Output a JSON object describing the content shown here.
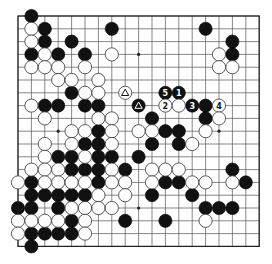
{
  "board": {
    "size": 19,
    "origin_x": 18,
    "origin_y": 16,
    "step_x": 13.4,
    "step_y": 12.8,
    "stone_radius": 6.6,
    "star_points": [
      [
        3,
        3
      ],
      [
        9,
        3
      ],
      [
        15,
        3
      ],
      [
        3,
        9
      ],
      [
        9,
        9
      ],
      [
        15,
        9
      ],
      [
        3,
        15
      ],
      [
        9,
        15
      ],
      [
        15,
        15
      ]
    ],
    "colors": {
      "black": "#111111",
      "white": "#ffffff",
      "line": "#555555"
    }
  },
  "stones": {
    "black": [
      [
        1,
        0
      ],
      [
        2,
        1
      ],
      [
        7,
        1
      ],
      [
        14,
        1
      ],
      [
        2,
        2
      ],
      [
        4,
        2
      ],
      [
        16,
        2
      ],
      [
        1,
        3
      ],
      [
        3,
        3
      ],
      [
        5,
        3
      ],
      [
        16,
        3
      ],
      [
        4,
        6
      ],
      [
        11,
        6
      ],
      [
        12,
        6
      ],
      [
        2,
        7
      ],
      [
        3,
        7
      ],
      [
        5,
        7
      ],
      [
        6,
        7
      ],
      [
        9,
        7
      ],
      [
        13,
        7
      ],
      [
        14,
        7
      ],
      [
        10,
        8
      ],
      [
        14,
        8
      ],
      [
        6,
        9
      ],
      [
        11,
        9
      ],
      [
        12,
        9
      ],
      [
        5,
        10
      ],
      [
        6,
        10
      ],
      [
        10,
        10
      ],
      [
        12,
        10
      ],
      [
        3,
        11
      ],
      [
        4,
        11
      ],
      [
        6,
        11
      ],
      [
        7,
        11
      ],
      [
        9,
        11
      ],
      [
        4,
        12
      ],
      [
        5,
        12
      ],
      [
        6,
        12
      ],
      [
        8,
        12
      ],
      [
        16,
        12
      ],
      [
        1,
        13
      ],
      [
        6,
        13
      ],
      [
        11,
        13
      ],
      [
        12,
        13
      ],
      [
        17,
        13
      ],
      [
        1,
        14
      ],
      [
        2,
        14
      ],
      [
        3,
        14
      ],
      [
        4,
        14
      ],
      [
        5,
        14
      ],
      [
        10,
        14
      ],
      [
        13,
        14
      ],
      [
        0,
        15
      ],
      [
        1,
        15
      ],
      [
        3,
        15
      ],
      [
        14,
        15
      ],
      [
        15,
        15
      ],
      [
        16,
        15
      ],
      [
        4,
        16
      ],
      [
        8,
        16
      ],
      [
        11,
        16
      ],
      [
        1,
        17
      ],
      [
        2,
        17
      ],
      [
        3,
        17
      ],
      [
        4,
        17
      ],
      [
        1,
        18
      ]
    ],
    "white": [
      [
        1,
        1
      ],
      [
        1,
        2
      ],
      [
        2,
        3
      ],
      [
        7,
        3
      ],
      [
        15,
        3
      ],
      [
        1,
        4
      ],
      [
        2,
        4
      ],
      [
        3,
        4
      ],
      [
        5,
        4
      ],
      [
        15,
        4
      ],
      [
        16,
        4
      ],
      [
        3,
        5
      ],
      [
        4,
        5
      ],
      [
        6,
        5
      ],
      [
        5,
        6
      ],
      [
        6,
        6
      ],
      [
        8,
        6
      ],
      [
        1,
        7
      ],
      [
        11,
        7
      ],
      [
        12,
        7
      ],
      [
        15,
        7
      ],
      [
        2,
        8
      ],
      [
        6,
        8
      ],
      [
        7,
        8
      ],
      [
        15,
        8
      ],
      [
        4,
        9
      ],
      [
        5,
        9
      ],
      [
        7,
        9
      ],
      [
        9,
        9
      ],
      [
        10,
        9
      ],
      [
        14,
        9
      ],
      [
        2,
        10
      ],
      [
        4,
        10
      ],
      [
        7,
        10
      ],
      [
        13,
        10
      ],
      [
        2,
        11
      ],
      [
        5,
        11
      ],
      [
        1,
        12
      ],
      [
        2,
        12
      ],
      [
        3,
        12
      ],
      [
        7,
        12
      ],
      [
        10,
        12
      ],
      [
        11,
        12
      ],
      [
        12,
        12
      ],
      [
        0,
        13
      ],
      [
        2,
        13
      ],
      [
        3,
        13
      ],
      [
        4,
        13
      ],
      [
        5,
        13
      ],
      [
        7,
        13
      ],
      [
        8,
        13
      ],
      [
        10,
        13
      ],
      [
        13,
        13
      ],
      [
        14,
        13
      ],
      [
        16,
        13
      ],
      [
        6,
        14
      ],
      [
        8,
        14
      ],
      [
        4,
        15
      ],
      [
        5,
        15
      ],
      [
        6,
        15
      ],
      [
        7,
        15
      ],
      [
        0,
        16
      ],
      [
        1,
        16
      ],
      [
        2,
        16
      ],
      [
        3,
        16
      ],
      [
        5,
        16
      ],
      [
        14,
        16
      ],
      [
        0,
        17
      ],
      [
        5,
        17
      ]
    ]
  },
  "annotations": {
    "numbered_moves": [
      {
        "label": "1",
        "color": "black",
        "x": 12,
        "y": 6
      },
      {
        "label": "2",
        "color": "white",
        "x": 11,
        "y": 7
      },
      {
        "label": "3",
        "color": "black",
        "x": 13,
        "y": 7
      },
      {
        "label": "4",
        "color": "white",
        "x": 15,
        "y": 7
      },
      {
        "label": "5",
        "color": "black",
        "x": 11,
        "y": 6
      }
    ],
    "triangle_marks": [
      {
        "color": "white",
        "x": 8,
        "y": 6
      },
      {
        "color": "black",
        "x": 9,
        "y": 7
      }
    ]
  }
}
